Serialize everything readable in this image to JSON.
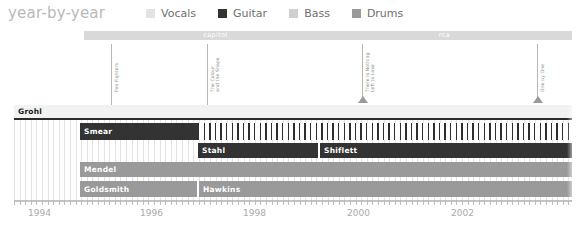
{
  "header": {
    "title": "year-by-year"
  },
  "legend": {
    "items": [
      {
        "label": "Vocals",
        "color": "#e3e3e3",
        "icon": "square-swatch-icon"
      },
      {
        "label": "Guitar",
        "color": "#333333",
        "icon": "square-swatch-icon"
      },
      {
        "label": "Bass",
        "color": "#cfcfcf",
        "icon": "square-swatch-icon"
      },
      {
        "label": "Drums",
        "color": "#9a9a9a",
        "icon": "square-swatch-icon"
      }
    ]
  },
  "record_labels": [
    {
      "name": "capitol",
      "left": 84,
      "width": 263,
      "color": "#d9d9d9"
    },
    {
      "name": "rca",
      "left": 317,
      "width": 255,
      "color": "#d9d9d9"
    }
  ],
  "albums": [
    {
      "title": "Foo Fighters",
      "lines": [
        "Foo Fighters"
      ],
      "x": 111,
      "marker": false
    },
    {
      "title": "The Colour and the Shape",
      "lines": [
        "The Colour",
        "and the Shape"
      ],
      "x": 207,
      "marker": false
    },
    {
      "title": "There Is Nothing Left to Lose",
      "lines": [
        "There Is Nothing",
        "Left to Lose"
      ],
      "x": 362,
      "marker": true
    },
    {
      "title": "One by One",
      "lines": [
        "One by One"
      ],
      "x": 537,
      "marker": true
    }
  ],
  "chart_data": {
    "type": "table",
    "title": "year-by-year",
    "xlabel": "",
    "ylabel": "",
    "xlim": [
      1994,
      2003.2
    ],
    "grid": true,
    "legend_position": "top",
    "categories": [
      "Vocals",
      "Guitar",
      "Bass",
      "Drums"
    ],
    "tick_labels": [
      "1994",
      "1996",
      "1998",
      "2000",
      "2002"
    ],
    "tick_positions": [
      28,
      140,
      243,
      347,
      451
    ],
    "rows": [
      {
        "row_name": "vocals-row",
        "instrument": "Vocals",
        "top": 0,
        "height": 13,
        "segments": [
          {
            "name": "Grohl",
            "left": 0,
            "width": 558,
            "style": "light"
          }
        ],
        "underline": {
          "left": 0,
          "width": 558
        }
      },
      {
        "row_name": "guitar-row-1",
        "instrument": "Guitar",
        "top": 18,
        "height": 17,
        "segments": [
          {
            "name": "Smear",
            "left": 66,
            "width": 118,
            "style": "dark"
          },
          {
            "name": "",
            "left": 184,
            "width": 374,
            "style": "hatchdark"
          }
        ]
      },
      {
        "row_name": "guitar-row-2",
        "instrument": "Guitar",
        "top": 38,
        "height": 15,
        "segments": [
          {
            "name": "Stahl",
            "left": 184,
            "width": 120,
            "style": "dark"
          },
          {
            "name": "Shiflett",
            "left": 306,
            "width": 252,
            "style": "dark"
          }
        ]
      },
      {
        "row_name": "bass-row",
        "instrument": "Bass",
        "top": 57,
        "height": 15,
        "segments": [
          {
            "name": "Mendel",
            "left": 66,
            "width": 492,
            "style": "mid"
          }
        ]
      },
      {
        "row_name": "drums-row",
        "instrument": "Drums",
        "top": 76,
        "height": 16,
        "segments": [
          {
            "name": "Goldsmith",
            "left": 66,
            "width": 117,
            "style": "mid"
          },
          {
            "name": "Hawkins",
            "left": 185,
            "width": 373,
            "style": "mid"
          }
        ]
      }
    ]
  }
}
